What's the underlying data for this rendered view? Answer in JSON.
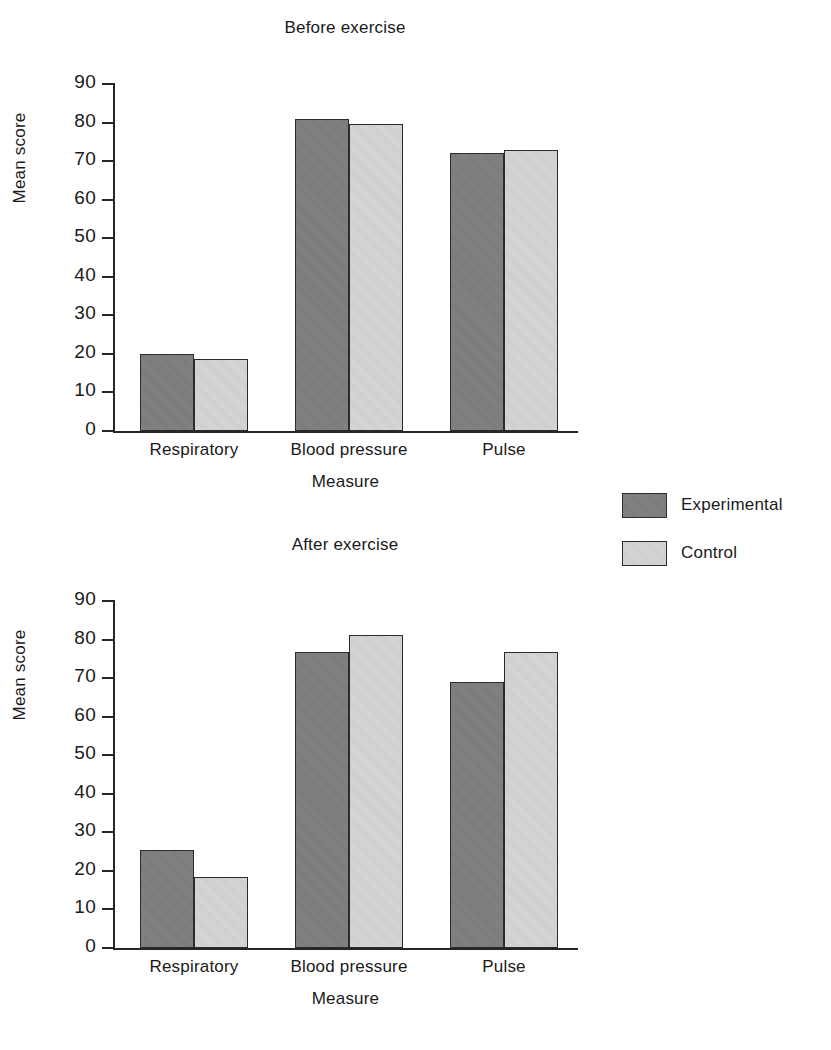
{
  "legend": {
    "position": "right",
    "entries": [
      {
        "label": "Experimental",
        "color": "#7e7e7e",
        "key": "exp"
      },
      {
        "label": "Control",
        "color": "#d2d2d2",
        "key": "ctl"
      }
    ]
  },
  "chart_data": [
    {
      "type": "bar",
      "title": "Before exercise",
      "xlabel": "Measure",
      "ylabel": "Mean score",
      "categories": [
        "Respiratory",
        "Blood pressure",
        "Pulse"
      ],
      "series": [
        {
          "name": "Experimental",
          "color": "#7e7e7e",
          "values": [
            20.0,
            81.0,
            72.0
          ]
        },
        {
          "name": "Control",
          "color": "#d2d2d2",
          "values": [
            18.7,
            79.5,
            72.8
          ]
        }
      ],
      "ylim": [
        0,
        90
      ],
      "yticks": [
        90,
        80,
        70,
        60,
        50,
        40,
        30,
        20,
        10,
        0
      ],
      "grid": false
    },
    {
      "type": "bar",
      "title": "After exercise",
      "xlabel": "Measure",
      "ylabel": "Mean score",
      "categories": [
        "Respiratory",
        "Blood pressure",
        "Pulse"
      ],
      "series": [
        {
          "name": "Experimental",
          "color": "#7e7e7e",
          "values": [
            25.3,
            76.7,
            68.9
          ]
        },
        {
          "name": "Control",
          "color": "#d2d2d2",
          "values": [
            18.3,
            81.3,
            76.7
          ]
        }
      ],
      "ylim": [
        0,
        90
      ],
      "yticks": [
        90,
        80,
        70,
        60,
        50,
        40,
        30,
        20,
        10,
        0
      ],
      "grid": false
    }
  ]
}
